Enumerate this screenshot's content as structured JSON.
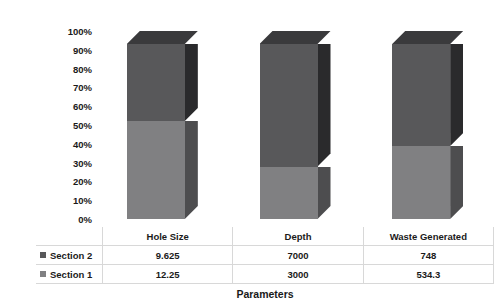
{
  "chart_data": {
    "type": "bar",
    "subtype": "100% stacked column (3-D)",
    "title": "",
    "xlabel": "Parameters",
    "ylabel": "Percentage",
    "categories": [
      "Hole Size",
      "Depth",
      "Waste Generated"
    ],
    "ytick_labels": [
      "100%",
      "90%",
      "80%",
      "70%",
      "60%",
      "50%",
      "40%",
      "30%",
      "20%",
      "10%",
      "0%"
    ],
    "ytick_values": [
      100,
      90,
      80,
      70,
      60,
      50,
      40,
      30,
      20,
      10,
      0
    ],
    "ylim": [
      0,
      100
    ],
    "grid": false,
    "legend_position": "table-left",
    "series": [
      {
        "name": "Section 2",
        "values": [
          9.625,
          7000,
          748
        ],
        "display_values": [
          "9.625",
          "7000",
          "748"
        ],
        "percent_values": [
          44.0,
          70.0,
          58.3
        ],
        "color": "#58585a",
        "side_color": "#2a2a2c",
        "top_color": "#3a3a3c"
      },
      {
        "name": "Section 1",
        "values": [
          12.25,
          3000,
          534.3
        ],
        "display_values": [
          "12.25",
          "3000",
          "534.3"
        ],
        "percent_values": [
          56.0,
          30.0,
          41.7
        ],
        "color": "#808082",
        "side_color": "#4d4d4f",
        "top_color": "#6a6a6c"
      }
    ],
    "table": {
      "corner_label": "",
      "column_headers": [
        "Hole Size",
        "Depth",
        "Waste Generated"
      ],
      "rows": [
        {
          "label": "Section 2",
          "swatch_color": "#58585a",
          "cells": [
            "9.625",
            "7000",
            "748"
          ]
        },
        {
          "label": "Section 1",
          "swatch_color": "#808082",
          "cells": [
            "12.25",
            "3000",
            "534.3"
          ]
        }
      ]
    }
  }
}
